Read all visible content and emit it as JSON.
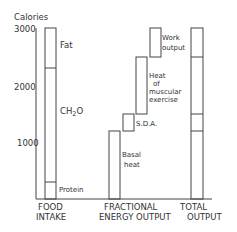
{
  "axis": {
    "title": "Calories",
    "ticks": [
      {
        "value": 3000,
        "label": "3000"
      },
      {
        "value": 2000,
        "label": "2000"
      },
      {
        "value": 1000,
        "label": "1000"
      }
    ],
    "max": 3000
  },
  "food_intake": {
    "label_line1": "FOOD",
    "label_line2": "INTAKE",
    "segments": [
      {
        "name": "Protein",
        "label": "Protein",
        "from": 0,
        "to": 300
      },
      {
        "name": "CH2O",
        "label_main": "CH",
        "label_sub": "2",
        "label_end": "O",
        "from": 300,
        "to": 2300
      },
      {
        "name": "Fat",
        "label": "Fat",
        "from": 2300,
        "to": 3000
      }
    ]
  },
  "fractional_output": {
    "label_line1": "FRACTIONAL",
    "label_line2": "ENERGY OUTPUT",
    "segments": [
      {
        "name": "Basal heat",
        "label_line1": "Basal",
        "label_line2": "heat",
        "from": 0,
        "to": 1200
      },
      {
        "name": "S.D.A.",
        "label": "S.D.A.",
        "from": 1200,
        "to": 1500
      },
      {
        "name": "Heat of muscular exercise",
        "label_line1": "Heat",
        "label_line2": "of",
        "label_line3": "muscular",
        "label_line4": "exercise",
        "from": 1500,
        "to": 2500
      },
      {
        "name": "Work output",
        "label_line1": "Work",
        "label_line2": "output",
        "from": 2500,
        "to": 3000
      }
    ]
  },
  "total_output": {
    "label_line1": "TOTAL",
    "label_line2": "OUTPUT",
    "divisions": [
      1200,
      1500,
      2500,
      3000
    ]
  }
}
